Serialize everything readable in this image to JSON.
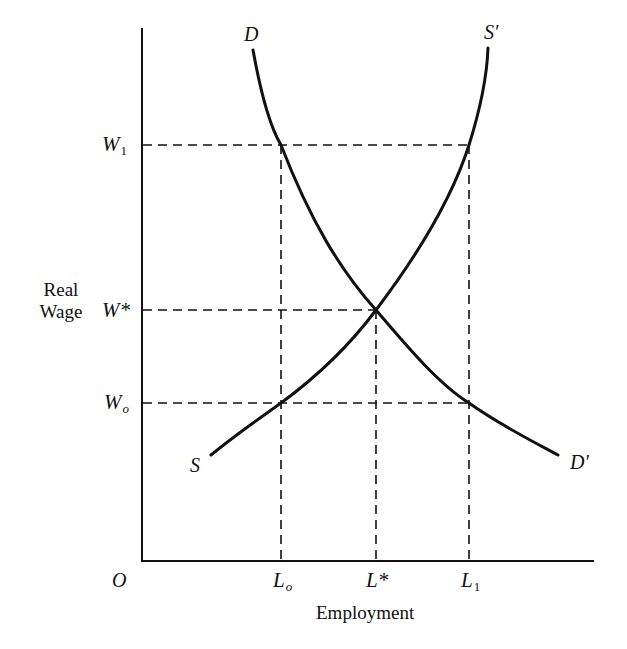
{
  "diagram": {
    "y_axis_label": [
      "Real",
      "Wage"
    ],
    "x_axis_label": "Employment",
    "origin_label": "O",
    "wage_levels": [
      {
        "id": "W1",
        "base": "W",
        "sub": "1",
        "y": 145
      },
      {
        "id": "Wstar",
        "base": "W*",
        "sub": "",
        "y": 310
      },
      {
        "id": "Wo",
        "base": "W",
        "sub": "o",
        "y": 403
      }
    ],
    "employment_levels": [
      {
        "id": "Lo",
        "base": "L",
        "sub": "o",
        "x": 281
      },
      {
        "id": "Lstar",
        "base": "L*",
        "sub": "",
        "x": 376
      },
      {
        "id": "L1",
        "base": "L",
        "sub": "1",
        "x": 469
      }
    ],
    "curves": {
      "demand": {
        "start_label": "D",
        "end_label": "D′"
      },
      "supply": {
        "start_label": "S",
        "end_label": "S′"
      }
    },
    "equilibrium": {
      "wage": "W*",
      "employment": "L*"
    },
    "colors": {
      "line": "#111111",
      "background": "#ffffff"
    }
  }
}
